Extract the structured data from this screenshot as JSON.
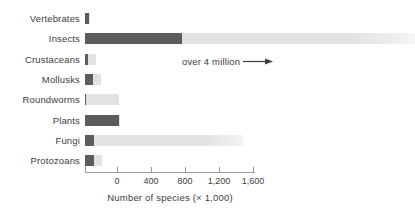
{
  "chart_data": {
    "type": "bar",
    "orientation": "horizontal",
    "title": "",
    "xlabel": "Number of species (× 1,000)",
    "ylabel": "",
    "xlim": [
      -380,
      1700
    ],
    "xticks": [
      0,
      400,
      800,
      1200,
      1600
    ],
    "xtick_labels": [
      "0",
      "400",
      "800",
      "1,200",
      "1,600"
    ],
    "grid": false,
    "legend": false,
    "categories": [
      "Vertebrates",
      "Insects",
      "Crustaceans",
      "Mollusks",
      "Roundworms",
      "Plants",
      "Fungi",
      "Protozoans"
    ],
    "series": [
      {
        "name": "known species",
        "color": "#5c5c5c",
        "values": [
          50,
          1150,
          40,
          100,
          20,
          400,
          110,
          110
        ]
      },
      {
        "name": "estimated additional species",
        "color": "#e2e2e2",
        "values": [
          10,
          3500,
          95,
          90,
          380,
          10,
          1770,
          90
        ]
      }
    ],
    "annotations": [
      {
        "text": "over 4 million",
        "target_category": "Insects",
        "arrow": "right-arrow"
      }
    ]
  },
  "axis": {
    "title": "Number of species (× 1,000)",
    "tick_labels": [
      "0",
      "400",
      "800",
      "1,200",
      "1,600"
    ]
  },
  "categories": {
    "items": [
      {
        "label": "Vertebrates"
      },
      {
        "label": "Insects"
      },
      {
        "label": "Crustaceans"
      },
      {
        "label": "Mollusks"
      },
      {
        "label": "Roundworms"
      },
      {
        "label": "Plants"
      },
      {
        "label": "Fungi"
      },
      {
        "label": "Protozoans"
      }
    ]
  },
  "annotation": {
    "text": "over 4 million"
  },
  "colors": {
    "bar_dark": "#5c5c5c",
    "bar_light": "#e2e2e2",
    "axis": "#9a9a9a",
    "text": "#3d3d3d",
    "background": "#ffffff"
  }
}
